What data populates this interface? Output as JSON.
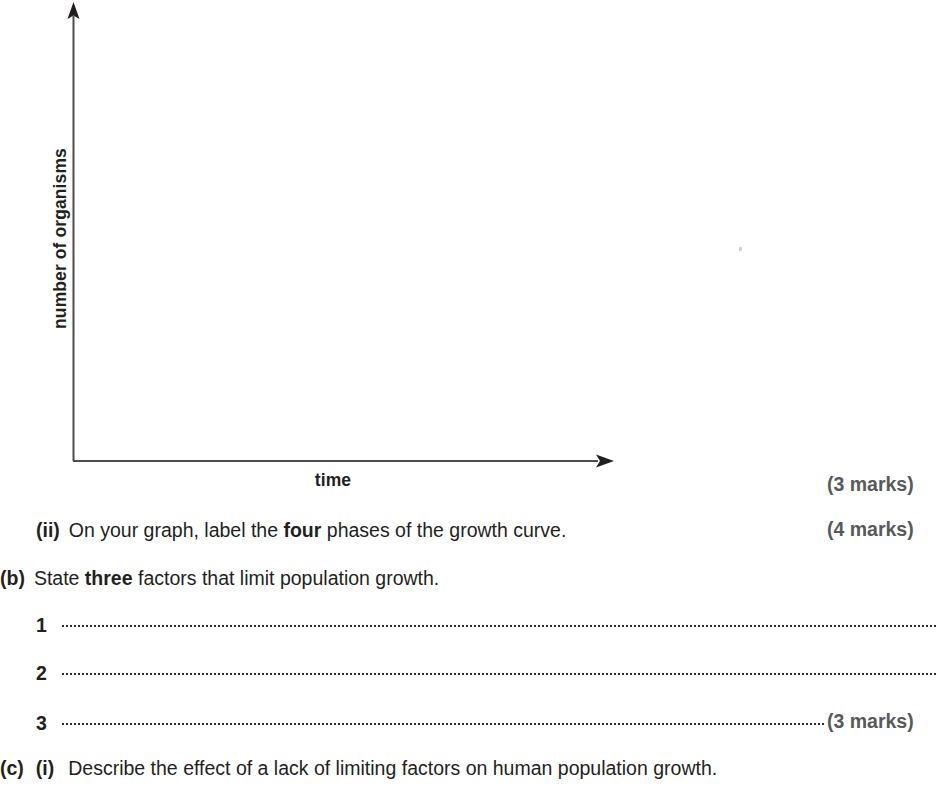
{
  "figure": {
    "name": "population-growth-axes",
    "y_axis_label": "number of organisms",
    "x_axis_label": "time",
    "axis_color": "#4d4d4f",
    "has_y_arrow": true,
    "has_x_arrow": true
  },
  "marks": {
    "graph_marks": "(3 marks)",
    "part_ii_marks": "(4 marks)",
    "part_b_marks": "(3 marks)"
  },
  "questions": {
    "part_ii": {
      "label": "(ii)",
      "text_before": "On your graph, label the ",
      "emphasis": "four",
      "text_after": " phases of the growth curve."
    },
    "part_b": {
      "label": "(b)",
      "text_before": "State ",
      "emphasis": "three",
      "text_after": " factors that limit population growth."
    },
    "part_c": {
      "label": "(c)",
      "sub_label": "(i)",
      "text": "Describe the effect of a lack of limiting factors on human population growth."
    }
  },
  "answer_lines": [
    {
      "number": "1"
    },
    {
      "number": "2"
    },
    {
      "number": "3"
    }
  ],
  "colors": {
    "ink": "#231f20",
    "marks_grey": "#58595b",
    "rule_grey": "#4d4d4f"
  }
}
